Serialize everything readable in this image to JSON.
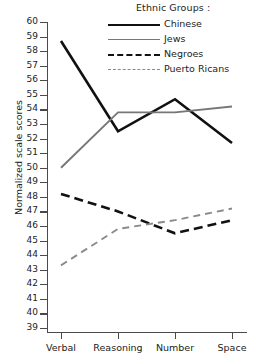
{
  "legend": {
    "title": "Ethnic Groups :",
    "entries": [
      {
        "label": "Chinese",
        "style": "solid-black",
        "color": "#111111"
      },
      {
        "label": "Jews",
        "style": "solid-gray",
        "color": "#777777"
      },
      {
        "label": "Negroes",
        "style": "dashed-black",
        "color": "#111111"
      },
      {
        "label": "Puerto Ricans",
        "style": "dashed-gray",
        "color": "#8a8a8a"
      }
    ]
  },
  "axes": {
    "ylabel": "Normalized scale scores",
    "yticks": [
      60,
      59,
      58,
      57,
      56,
      55,
      54,
      53,
      52,
      51,
      50,
      49,
      48,
      47,
      46,
      45,
      44,
      43,
      42,
      41,
      40,
      39
    ],
    "xticklabels": [
      "Verbal",
      "Reasoning",
      "Number",
      "Space"
    ]
  },
  "chart_data": {
    "type": "line",
    "title": "",
    "xlabel": "",
    "ylabel": "Normalized scale scores",
    "categories": [
      "Verbal",
      "Reasoning",
      "Number",
      "Space"
    ],
    "ylim": [
      39,
      60
    ],
    "grid": false,
    "legend_position": "top-right",
    "legend_title": "Ethnic Groups :",
    "series": [
      {
        "name": "Chinese",
        "values": [
          58.7,
          52.5,
          54.7,
          51.7
        ],
        "color": "#111111",
        "dash": "solid",
        "width": 2.6
      },
      {
        "name": "Jews",
        "values": [
          50.0,
          53.8,
          53.8,
          54.2
        ],
        "color": "#777777",
        "dash": "solid",
        "width": 1.9
      },
      {
        "name": "Negroes",
        "values": [
          48.2,
          47.0,
          45.5,
          46.4
        ],
        "color": "#111111",
        "dash": "dashed",
        "width": 2.6
      },
      {
        "name": "Puerto Ricans",
        "values": [
          43.3,
          45.8,
          46.4,
          47.2
        ],
        "color": "#8a8a8a",
        "dash": "dashed",
        "width": 1.9
      }
    ]
  }
}
